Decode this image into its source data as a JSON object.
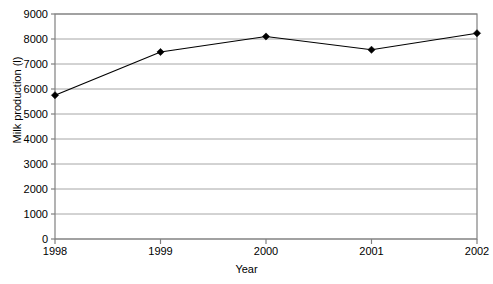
{
  "chart_data": {
    "type": "line",
    "title": "",
    "xlabel": "Year",
    "ylabel": "Milk production (l)",
    "categories": [
      "1998",
      "1999",
      "2000",
      "2001",
      "2002"
    ],
    "values": [
      5750,
      7480,
      8100,
      7570,
      8230
    ],
    "series": [
      {
        "name": "Milk production",
        "values": [
          5750,
          7480,
          8100,
          7570,
          8230
        ]
      }
    ],
    "ylim": [
      0,
      9000
    ],
    "ytick_labels": [
      "0",
      "1000",
      "2000",
      "3000",
      "4000",
      "5000",
      "6000",
      "7000",
      "8000",
      "9000"
    ],
    "ytick_values": [
      0,
      1000,
      2000,
      3000,
      4000,
      5000,
      6000,
      7000,
      8000,
      9000
    ],
    "xtick_labels": [
      "1998",
      "1999",
      "2000",
      "2001",
      "2002"
    ],
    "grid": "horizontal",
    "legend": "none",
    "marker": "diamond",
    "colors": {
      "line": "#000000",
      "marker": "#000000",
      "gridline": "#a6a6a6",
      "axis": "#808080",
      "text": "#000000",
      "background": "#ffffff"
    }
  }
}
